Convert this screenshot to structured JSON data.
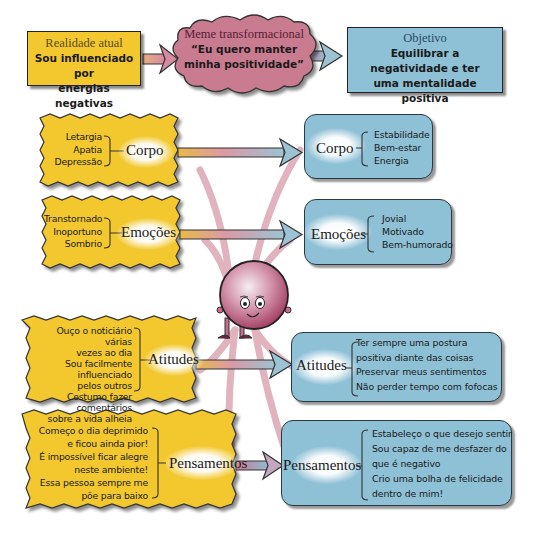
{
  "top_row": {
    "current_reality": {
      "title": "Realidade atual",
      "body": [
        "Sou influenciado por",
        "energias negativas"
      ]
    },
    "transformational_meme": {
      "title": "Meme transformacional",
      "body": [
        "“Eu quero manter",
        "minha positividade”"
      ]
    },
    "goal": {
      "title": "Objetivo",
      "body": [
        "Equilibrar a",
        "negatividade e ter",
        "uma mentalidade positiva"
      ]
    }
  },
  "rows": [
    {
      "category": "Corpo",
      "negatives": [
        "Letargia",
        "Apatia",
        "Depressão"
      ],
      "positives": [
        "Estabilidade",
        "Bem-estar",
        "Energia"
      ]
    },
    {
      "category": "Emoções",
      "negatives": [
        "Transtornado",
        "Inoportuno",
        "Sombrio"
      ],
      "positives": [
        "Jovial",
        "Motivado",
        "Bem-humorado"
      ]
    },
    {
      "category": "Atitudes",
      "negatives": [
        "Ouço o noticiário várias",
        "vezes ao dia",
        "Sou facilmente influenciado",
        "pelos outros",
        "Costumo fazer comentários",
        "sobre a vida alheia"
      ],
      "positives": [
        "Ter sempre uma postura",
        "positiva diante das coisas",
        "Preservar meus sentimentos",
        "Não perder tempo com fofocas"
      ]
    },
    {
      "category": "Pensamentos",
      "negatives": [
        "Começo o dia deprimido",
        "e ficou ainda pior!",
        "É impossível ficar alegre",
        "neste ambiente!",
        "Essa pessoa sempre me",
        "põe para baixo"
      ],
      "positives": [
        "Estabeleço o que desejo sentir",
        "Sou capaz de me desfazer do",
        "que é negativo",
        "Crio uma bolha de felicidade",
        "dentro de mim!"
      ]
    }
  ],
  "colors": {
    "yellow": "#f2c82e",
    "blue": "#8ec0d6",
    "pink": "#c97b90",
    "character": "#a5385e"
  },
  "icons": {
    "character": "smiling-balloon-character-icon",
    "arrow": "right-arrow-icon"
  }
}
